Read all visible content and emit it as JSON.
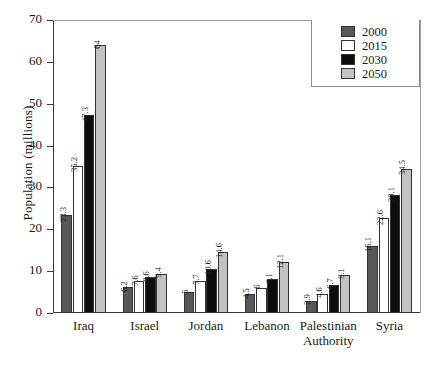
{
  "chart_data": {
    "type": "bar",
    "title": "",
    "xlabel": "",
    "ylabel": "Population (millions)",
    "ylim": [
      0,
      70
    ],
    "ytick_values": [
      0,
      10,
      20,
      30,
      40,
      50,
      60,
      70
    ],
    "ytick_labels": [
      "0",
      "10",
      "20",
      "30",
      "40",
      "50",
      "60",
      "70"
    ],
    "grid": false,
    "legend_position": "top-right",
    "categories": [
      "Iraq",
      "Israel",
      "Jordan",
      "Lebanon",
      "Palestinian Authority",
      "Syria"
    ],
    "series": [
      {
        "name": "2000",
        "color": "#585858",
        "values": [
          23.3,
          6.2,
          5,
          4.5,
          2.9,
          16.1
        ],
        "labels": [
          "23.3",
          "6.2",
          "5",
          "4.5",
          "2.9",
          "16.1"
        ]
      },
      {
        "name": "2015",
        "color": "#ffffff",
        "values": [
          35.2,
          7.6,
          7.7,
          6,
          4.6,
          22.6
        ],
        "labels": [
          "35.2",
          "7.6",
          "7.7",
          "6",
          "4.6",
          "22.6"
        ]
      },
      {
        "name": "2030",
        "color": "#0d0d0d",
        "values": [
          47.3,
          8.6,
          10.6,
          8.1,
          6.7,
          28.1
        ],
        "labels": [
          "47.3",
          "8.6",
          "10.6",
          "8.1",
          "6.7",
          "28.1"
        ]
      },
      {
        "name": "2050",
        "color": "#c2c2c2",
        "values": [
          64,
          9.4,
          14.6,
          12.1,
          9.1,
          34.5
        ],
        "labels": [
          "64",
          "9.4",
          "14.6",
          "12.1",
          "9.1",
          "34.5"
        ]
      }
    ]
  },
  "legend": {
    "items": [
      {
        "label": "2000",
        "color": "#585858"
      },
      {
        "label": "2015",
        "color": "#ffffff"
      },
      {
        "label": "2030",
        "color": "#0d0d0d"
      },
      {
        "label": "2050",
        "color": "#c2c2c2"
      }
    ]
  },
  "axis": {
    "y_title": "Population (millions)"
  }
}
